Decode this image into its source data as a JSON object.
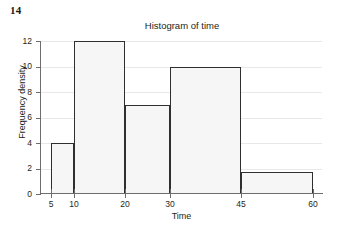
{
  "exercise": {
    "number": "14"
  },
  "chart_data": {
    "type": "bar",
    "title": "Histogram of time",
    "xlabel": "Time",
    "ylabel": "Frequency density",
    "grid": true,
    "legend": "none",
    "xlim": [
      5,
      60
    ],
    "ylim": [
      0,
      12
    ],
    "x_ticks": [
      5,
      10,
      20,
      30,
      45,
      60
    ],
    "x_tick_labels": [
      "5",
      "10",
      "20",
      "30",
      "45",
      "60"
    ],
    "y_ticks": [
      0,
      2,
      4,
      6,
      8,
      10,
      12
    ],
    "y_tick_labels": [
      "0",
      "2",
      "4",
      "6",
      "8",
      "10",
      "12"
    ],
    "bin_edges": [
      5,
      10,
      20,
      30,
      45,
      60
    ],
    "categories": [
      "5-10",
      "10-20",
      "20-30",
      "30-45",
      "45-60"
    ],
    "values": [
      4,
      12,
      7,
      10,
      1.7
    ],
    "bars": [
      {
        "label": "5-10",
        "x0": 5,
        "x1": 10,
        "frequency_density": 4
      },
      {
        "label": "10-20",
        "x0": 10,
        "x1": 20,
        "frequency_density": 12
      },
      {
        "label": "20-30",
        "x0": 20,
        "x1": 30,
        "frequency_density": 7
      },
      {
        "label": "30-45",
        "x0": 30,
        "x1": 45,
        "frequency_density": 10
      },
      {
        "label": "45-60",
        "x0": 45,
        "x1": 60,
        "frequency_density": 1.7
      }
    ],
    "colors": {
      "bar_fill": "#f6f6f6",
      "bar_edge": "#2f2f2f",
      "gridline": "#e8e8e8",
      "axis": "#6d6d6d",
      "text": "#231f20",
      "background": "#ffffff"
    }
  }
}
